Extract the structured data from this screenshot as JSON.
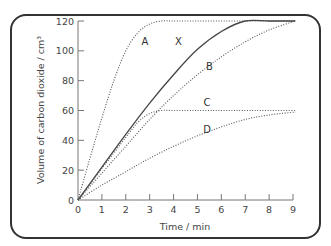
{
  "chart_data": {
    "type": "line",
    "title": "",
    "xlabel": "Time / min",
    "ylabel": "Volume of carbon dioxide / cm³",
    "xlim": [
      0,
      9
    ],
    "ylim": [
      0,
      120
    ],
    "x_ticks": [
      0,
      1,
      2,
      3,
      4,
      5,
      6,
      7,
      8,
      9
    ],
    "y_ticks": [
      0,
      20,
      40,
      60,
      80,
      100,
      120
    ],
    "grid": false,
    "legend": "inline curve labels",
    "series": [
      {
        "name": "A",
        "style": "dotted",
        "x": [
          0,
          0.5,
          1,
          1.5,
          2,
          2.5,
          3,
          3.5,
          4,
          5,
          6,
          7,
          8,
          9.1
        ],
        "y": [
          0,
          28,
          55,
          80,
          100,
          112,
          118,
          120,
          120,
          120,
          120,
          120,
          120,
          120
        ]
      },
      {
        "name": "X",
        "style": "solid",
        "x": [
          0,
          1,
          2,
          3,
          4,
          5,
          6,
          7,
          8,
          9.1
        ],
        "y": [
          0,
          22,
          44,
          65,
          84,
          101,
          113,
          120,
          120,
          120
        ]
      },
      {
        "name": "B",
        "style": "dotted",
        "x": [
          0,
          1,
          2,
          3,
          4,
          5,
          6,
          7,
          8,
          9.1
        ],
        "y": [
          0,
          18,
          36,
          54,
          70,
          84,
          96,
          106,
          114,
          120
        ]
      },
      {
        "name": "C",
        "style": "dotted",
        "x": [
          0,
          1,
          2,
          2.5,
          3,
          3.5,
          4,
          5,
          6,
          7,
          8,
          9.1
        ],
        "y": [
          0,
          21,
          42,
          52,
          58,
          60,
          60,
          60,
          60,
          60,
          60,
          60
        ]
      },
      {
        "name": "D",
        "style": "dotted",
        "x": [
          0,
          1,
          2,
          3,
          4,
          5,
          6,
          7,
          8,
          9.1
        ],
        "y": [
          0,
          10,
          19,
          28,
          36,
          43,
          49,
          54,
          57,
          59
        ]
      }
    ],
    "annotations": [
      {
        "text": "A",
        "x": 2.8,
        "y": 104
      },
      {
        "text": "X",
        "x": 4.2,
        "y": 104
      },
      {
        "text": "B",
        "x": 5.5,
        "y": 87
      },
      {
        "text": "C",
        "x": 5.4,
        "y": 63
      },
      {
        "text": "D",
        "x": 5.4,
        "y": 45
      }
    ]
  }
}
